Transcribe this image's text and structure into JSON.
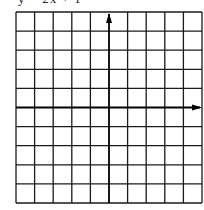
{
  "caption": {
    "text": "y = 2x + 1",
    "clipped": true
  },
  "graph": {
    "columns": 10,
    "rows": 10,
    "x_axis_row_index": 5,
    "y_axis_column_index": 5,
    "x_axis_arrow": "right",
    "y_axis_arrow": "up",
    "grid_color": "#1a1a1a",
    "axis_color": "#000000"
  }
}
